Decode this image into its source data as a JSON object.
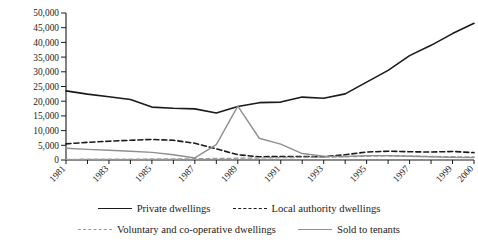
{
  "chart_data": {
    "type": "line",
    "title": "",
    "xlabel": "",
    "ylabel": "",
    "grid": false,
    "legend_position": "bottom",
    "ylim": [
      0,
      50000
    ],
    "ytick_step": 5000,
    "yticks": [
      "0",
      "5,000",
      "10,000",
      "15,000",
      "20,000",
      "25,000",
      "30,000",
      "35,000",
      "40,000",
      "45,000",
      "50,000"
    ],
    "ytick_values": [
      0,
      5000,
      10000,
      15000,
      20000,
      25000,
      30000,
      35000,
      40000,
      45000,
      50000
    ],
    "x": [
      1981,
      1982,
      1983,
      1984,
      1985,
      1986,
      1987,
      1988,
      1989,
      1990,
      1991,
      1992,
      1993,
      1994,
      1995,
      1996,
      1997,
      1998,
      1999,
      2000
    ],
    "xtick_labels": [
      "1981",
      "",
      "1983",
      "",
      "1985",
      "",
      "1987",
      "",
      "1989",
      "",
      "1991",
      "",
      "1993",
      "",
      "1995",
      "",
      "1997",
      "",
      "1999",
      "2000"
    ],
    "series": [
      {
        "name": "Private dwellings",
        "style": "solid",
        "color": "#1a1a1a",
        "width": 1.6,
        "values": [
          23500,
          22400,
          21500,
          20600,
          18000,
          17600,
          17400,
          16000,
          18200,
          19500,
          19700,
          21400,
          21000,
          22500,
          26500,
          30500,
          35500,
          39000,
          43000,
          46500
        ]
      },
      {
        "name": "Local authority dwellings",
        "style": "dashed",
        "color": "#1a1a1a",
        "width": 1.6,
        "values": [
          5500,
          6000,
          6400,
          6700,
          7000,
          6700,
          5700,
          3800,
          1800,
          1100,
          1200,
          1200,
          1100,
          1800,
          2700,
          3000,
          2800,
          2700,
          2900,
          2500
        ]
      },
      {
        "name": "Voluntary and co-operative dwellings",
        "style": "dashed",
        "color": "#9a9a9a",
        "width": 1.4,
        "values": [
          200,
          250,
          280,
          300,
          320,
          350,
          400,
          500,
          600,
          700,
          800,
          900,
          1000,
          1100,
          1300,
          1400,
          1300,
          1200,
          1100,
          1000
        ]
      },
      {
        "name": "Sold to tenants",
        "style": "solid",
        "color": "#8f8f8f",
        "width": 1.4,
        "values": [
          4000,
          3600,
          3300,
          3000,
          2600,
          1800,
          700,
          5200,
          18300,
          7400,
          5400,
          2200,
          1300,
          1200,
          1500,
          1500,
          1300,
          1100,
          900,
          800
        ]
      }
    ]
  },
  "legend": {
    "rows": [
      [
        {
          "label": "Private dwellings",
          "swatch": "solid-dark"
        },
        {
          "label": "Local authority dwellings",
          "swatch": "dashed-dark"
        }
      ],
      [
        {
          "label": "Voluntary and co-operative dwellings",
          "swatch": "dashed-gray"
        },
        {
          "label": "Sold to tenants",
          "swatch": "solid-gray"
        }
      ]
    ]
  }
}
